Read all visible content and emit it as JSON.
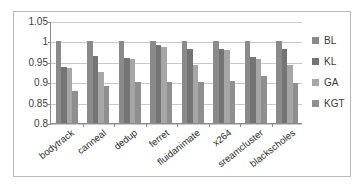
{
  "chart_data": {
    "type": "bar",
    "title": "",
    "subtitle": "",
    "xlabel": "",
    "ylabel": "",
    "ylim": [
      0.8,
      1.05
    ],
    "yticks": [
      "0.8",
      "0.85",
      "0.9",
      "0.95",
      "1",
      "1.05"
    ],
    "ytick_values": [
      0.8,
      0.85,
      0.9,
      0.95,
      1.0,
      1.05
    ],
    "grid": true,
    "legend_position": "right",
    "categories": [
      "bodytrack",
      "canneal",
      "dedup",
      "ferret",
      "fluidanimate",
      "x264",
      "sreamcluster",
      "blackscholes"
    ],
    "series": [
      {
        "name": "BL",
        "color": "#8a8a8a",
        "values": [
          1.0,
          1.0,
          1.0,
          1.0,
          1.0,
          1.0,
          1.0,
          1.0
        ]
      },
      {
        "name": "KL",
        "color": "#747474",
        "values": [
          0.937,
          0.965,
          0.96,
          0.99,
          0.982,
          0.982,
          0.963,
          0.982
        ]
      },
      {
        "name": "GA",
        "color": "#a6a6a6",
        "values": [
          0.934,
          0.925,
          0.957,
          0.987,
          0.943,
          0.978,
          0.958,
          0.943
        ]
      },
      {
        "name": "KGT",
        "color": "#8f8f8f",
        "values": [
          0.879,
          0.89,
          0.9,
          0.9,
          0.9,
          0.902,
          0.915,
          0.898
        ]
      }
    ]
  },
  "legend": {
    "items": [
      {
        "label": "BL",
        "color": "#8a8a8a"
      },
      {
        "label": "KL",
        "color": "#747474"
      },
      {
        "label": "GA",
        "color": "#a6a6a6"
      },
      {
        "label": "KGT",
        "color": "#8f8f8f"
      }
    ]
  }
}
